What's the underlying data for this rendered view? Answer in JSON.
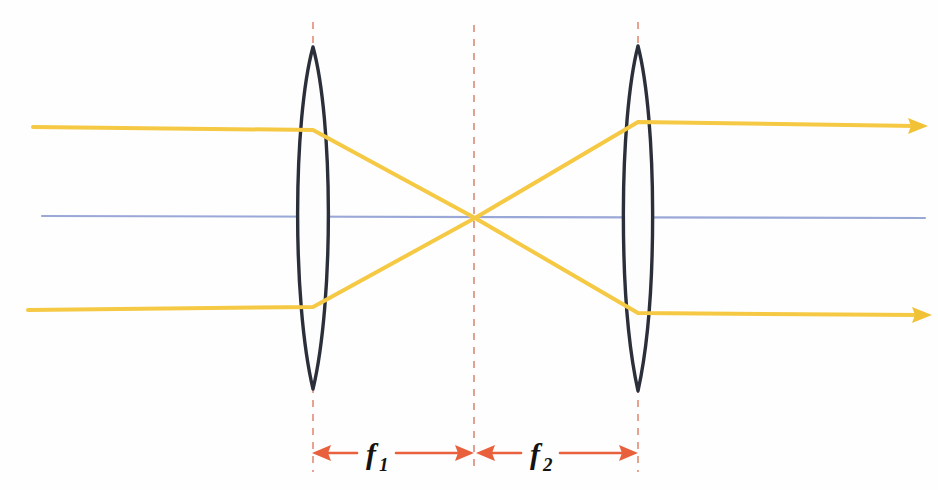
{
  "diagram": {
    "background_color": "#fefefe",
    "canvas": {
      "width": 938,
      "height": 490
    }
  },
  "colors": {
    "ray": "#f5c944",
    "ray_dark": "#edb92c",
    "lens_outline": "#2b2f3a",
    "lens_fill": "#fdfdfe",
    "optical_axis": "#9aa8d8",
    "dashed_guide": "#e8a28f",
    "dimension_arrow": "#e8603c",
    "label_text": "#15120f"
  },
  "optical_axis": {
    "name": "optical-axis",
    "x1": 42,
    "y1": 216,
    "x2": 925,
    "y2": 218
  },
  "lenses": [
    {
      "id": "lens-1",
      "label": "first converging lens",
      "center_x": 313,
      "top_y": 47,
      "bottom_y": 389,
      "half_width": 21
    },
    {
      "id": "lens-2",
      "label": "second converging lens",
      "center_x": 638,
      "top_y": 46,
      "bottom_y": 391,
      "half_width": 20
    }
  ],
  "focal_point": {
    "name": "common-focal-point",
    "x": 475,
    "y": 218,
    "label": "common focus"
  },
  "dashed_guides": [
    {
      "id": "guide-lens-1",
      "x": 313,
      "y1": 22,
      "y2": 472
    },
    {
      "id": "guide-focus",
      "x": 474,
      "y1": 25,
      "y2": 472
    },
    {
      "id": "guide-lens-2",
      "x": 638,
      "y1": 22,
      "y2": 472
    }
  ],
  "rays": [
    {
      "id": "ray-upper",
      "label": "upper parallel ray",
      "points": "33,127 313,130 475,218 638,122 916,126",
      "arrow_at": {
        "x": 922,
        "y": 126,
        "angle": 0.8
      }
    },
    {
      "id": "ray-lower",
      "label": "lower parallel ray",
      "points": "28,310 313,307 475,218 638,313 920,315",
      "arrow_at": {
        "x": 926,
        "y": 315,
        "angle": 0.4
      }
    }
  ],
  "dimensions": [
    {
      "id": "dimension-f1",
      "label_main": "f",
      "label_sub": "1",
      "description": "focal length of first lens",
      "x_start": 313,
      "x_end": 474,
      "y": 453,
      "label_x": 372,
      "label_y": 463
    },
    {
      "id": "dimension-f2",
      "label_main": "f",
      "label_sub": "2",
      "description": "focal length of second lens",
      "x_start": 475,
      "x_end": 638,
      "y": 453,
      "label_x": 535,
      "label_y": 463
    }
  ]
}
